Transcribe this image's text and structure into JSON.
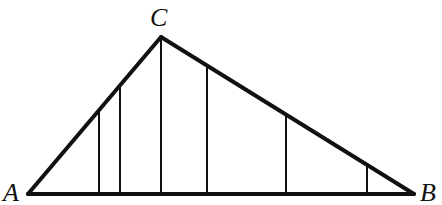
{
  "diagram": {
    "type": "triangle",
    "stroke_color": "#111111",
    "background": "#ffffff",
    "vertices": [
      {
        "label": "A",
        "x": 28,
        "y": 194,
        "label_x": 3,
        "label_y": 201
      },
      {
        "label": "C",
        "x": 161,
        "y": 37,
        "label_x": 150,
        "label_y": 26
      },
      {
        "label": "B",
        "x": 414,
        "y": 194,
        "label_x": 420,
        "label_y": 201
      }
    ],
    "sides": [
      {
        "from": "A",
        "to": "C",
        "width": 4
      },
      {
        "from": "C",
        "to": "B",
        "width": 4
      },
      {
        "from": "A",
        "to": "B",
        "width": 4
      }
    ],
    "vertical_segments": [
      {
        "x": 99,
        "y_top": 110,
        "y_bottom": 194
      },
      {
        "x": 120,
        "y_top": 85,
        "y_bottom": 194
      },
      {
        "x": 161,
        "y_top": 37,
        "y_bottom": 194
      },
      {
        "x": 207,
        "y_top": 66,
        "y_bottom": 194
      },
      {
        "x": 286,
        "y_top": 115,
        "y_bottom": 194
      },
      {
        "x": 367,
        "y_top": 165,
        "y_bottom": 194
      }
    ]
  }
}
